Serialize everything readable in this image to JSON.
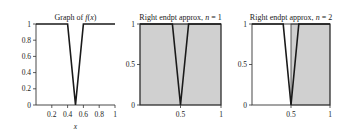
{
  "chart_data": [
    {
      "type": "line",
      "title": "Graph of f(x)",
      "title_parts": [
        "Graph of ",
        "f",
        "(",
        "x",
        ")"
      ],
      "xlabel": "x",
      "ylabel": "",
      "xlim": [
        0,
        1
      ],
      "ylim": [
        0,
        1
      ],
      "xticks": [
        0.2,
        0.4,
        0.6,
        0.8,
        1
      ],
      "xtick_labels": [
        "0.2",
        "0.4",
        "0.6",
        "0.8",
        "1"
      ],
      "yticks": [
        0,
        0.2,
        0.4,
        0.6,
        0.8,
        1
      ],
      "ytick_labels": [
        "0",
        "0.2",
        "0.4",
        "0.6",
        "0.8",
        "1"
      ],
      "series": [
        {
          "name": "f(x)",
          "x": [
            0,
            0.4,
            0.5,
            0.6,
            1
          ],
          "y": [
            1,
            1,
            0,
            1,
            1
          ]
        }
      ],
      "rectangles": [],
      "grid": false
    },
    {
      "type": "area",
      "title": "Right endpt approx, n = 1",
      "title_parts": [
        "Right endpt approx, ",
        "n",
        " = 1"
      ],
      "xlabel": "",
      "xlim": [
        0,
        1
      ],
      "ylim": [
        0,
        1
      ],
      "xticks": [
        0.5,
        1
      ],
      "xtick_labels": [
        "0.5",
        "1"
      ],
      "yticks": [
        0,
        0.5,
        1
      ],
      "ytick_labels": [
        "0",
        "0.5",
        "1"
      ],
      "series": [
        {
          "name": "f(x)",
          "x": [
            0,
            0.4,
            0.5,
            0.6,
            1
          ],
          "y": [
            1,
            1,
            0,
            1,
            1
          ]
        }
      ],
      "rectangles": [
        {
          "x0": 0,
          "x1": 1,
          "height": 1
        }
      ],
      "grid": false
    },
    {
      "type": "area",
      "title": "Right endpt approx, n = 2",
      "title_parts": [
        "Right endpt approx, ",
        "n",
        " = 2"
      ],
      "xlabel": "",
      "xlim": [
        0,
        1
      ],
      "ylim": [
        0,
        1
      ],
      "xticks": [
        0.5,
        1
      ],
      "xtick_labels": [
        "0.5",
        "1"
      ],
      "yticks": [
        0,
        0.5,
        1
      ],
      "ytick_labels": [
        "0",
        "0.5",
        "1"
      ],
      "series": [
        {
          "name": "f(x)",
          "x": [
            0,
            0.4,
            0.5,
            0.6,
            1
          ],
          "y": [
            1,
            1,
            0,
            1,
            1
          ]
        }
      ],
      "rectangles": [
        {
          "x0": 0,
          "x1": 0.5,
          "height": 0
        },
        {
          "x0": 0.5,
          "x1": 1,
          "height": 1
        }
      ],
      "grid": false
    }
  ],
  "colors": {
    "fill": "#d0d0d0",
    "line": "#1a1a1a",
    "axis": "#333333"
  }
}
